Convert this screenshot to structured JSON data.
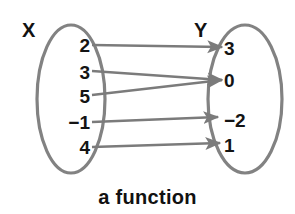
{
  "figure": {
    "caption": "a function",
    "width": 295,
    "height": 214,
    "background_color": "#ffffff",
    "stroke_color": "#808080",
    "text_color": "#141414"
  },
  "domain_set": {
    "label": "X",
    "label_x": 22,
    "label_y": 20,
    "ellipse": {
      "cx": 71,
      "cy": 99,
      "rx": 34,
      "ry": 74
    },
    "elements": [
      {
        "value": "2",
        "y": 45
      },
      {
        "value": "3",
        "y": 72
      },
      {
        "value": "5",
        "y": 96
      },
      {
        "value": "−1",
        "y": 122
      },
      {
        "value": "4",
        "y": 147
      }
    ]
  },
  "codomain_set": {
    "label": "Y",
    "label_x": 194,
    "label_y": 20,
    "ellipse": {
      "cx": 245,
      "cy": 99,
      "rx": 37,
      "ry": 74
    },
    "elements": [
      {
        "value": "3",
        "y": 48
      },
      {
        "value": "0",
        "y": 80
      },
      {
        "value": "−2",
        "y": 120
      },
      {
        "value": "1",
        "y": 145
      }
    ]
  },
  "mappings": [
    {
      "from": "2",
      "to": "3",
      "x1": 92,
      "y1": 45,
      "x2": 222,
      "y2": 47
    },
    {
      "from": "3",
      "to": "0",
      "x1": 92,
      "y1": 71,
      "x2": 222,
      "y2": 80
    },
    {
      "from": "5",
      "to": "0",
      "x1": 92,
      "y1": 95,
      "x2": 222,
      "y2": 80
    },
    {
      "from": "−1",
      "to": "−2",
      "x1": 92,
      "y1": 122,
      "x2": 218,
      "y2": 117
    },
    {
      "from": "4",
      "to": "1",
      "x1": 92,
      "y1": 147,
      "x2": 220,
      "y2": 143
    }
  ],
  "chart_data": {
    "type": "diagram",
    "diagram_kind": "mapping-diagram",
    "title": "a function",
    "sets": [
      {
        "name": "X",
        "role": "domain",
        "elements": [
          "2",
          "3",
          "5",
          "−1",
          "4"
        ]
      },
      {
        "name": "Y",
        "role": "codomain",
        "elements": [
          "3",
          "0",
          "−2",
          "1"
        ]
      }
    ],
    "edges": [
      {
        "from": "2",
        "to": "3"
      },
      {
        "from": "3",
        "to": "0"
      },
      {
        "from": "5",
        "to": "0"
      },
      {
        "from": "−1",
        "to": "−2"
      },
      {
        "from": "4",
        "to": "1"
      }
    ],
    "annotations": [
      "a function"
    ]
  }
}
